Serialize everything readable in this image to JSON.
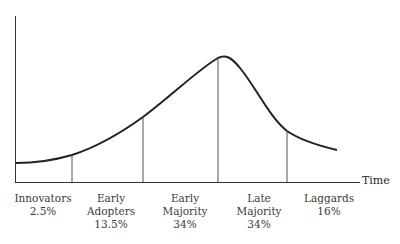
{
  "diagram": {
    "type": "diffusion-of-innovations-curve",
    "x_axis_label": "Time",
    "segments": [
      {
        "name_line1": "Innovators",
        "name_line2": "",
        "percent": "2.5%"
      },
      {
        "name_line1": "Early",
        "name_line2": "Adopters",
        "percent": "13.5%"
      },
      {
        "name_line1": "Early",
        "name_line2": "Majority",
        "percent": "34%"
      },
      {
        "name_line1": "Late",
        "name_line2": "Majority",
        "percent": "34%"
      },
      {
        "name_line1": "Laggards",
        "name_line2": "",
        "percent": "16%"
      }
    ],
    "colors": {
      "line": "#2a2a2a",
      "divider": "#555555"
    }
  }
}
